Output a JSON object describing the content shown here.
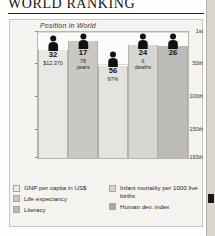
{
  "document": {
    "title": "WORLD RANKING"
  },
  "chart_data": {
    "type": "bar",
    "title": "WORLD RANKING",
    "subtitle": "Position in World",
    "ylabel": "Position in World",
    "xlabel": "",
    "grid": true,
    "legend_position": "bottom",
    "y_axis_inverted": true,
    "ylim": [
      1,
      193
    ],
    "ytick_labels": [
      "1st",
      "50th",
      "100th",
      "150th",
      "193th"
    ],
    "ytick_values": [
      1,
      50,
      100,
      150,
      193
    ],
    "categories": [
      "GNP per capita in US$",
      "Life expectancy",
      "Infant mortality per 1000 live births",
      "Literacy",
      "Human dev. index"
    ],
    "values": [
      32,
      17,
      56,
      24,
      26
    ],
    "bars": [
      {
        "category": "GNP per capita in US$",
        "rank": "32",
        "rank_value": 32,
        "detail": "$12,370",
        "color": "#e9e8e5"
      },
      {
        "category": "Life expectancy",
        "rank": "17",
        "rank_value": 17,
        "detail": "78 years",
        "detail_line1": "78",
        "detail_line2": "years",
        "color": "#c9c8c4"
      },
      {
        "category": "Infant mortality per 1000 live births",
        "rank": "56",
        "rank_value": 56,
        "detail": "97%",
        "color": "#e4e3e0"
      },
      {
        "category": "Literacy",
        "rank": "24",
        "rank_value": 24,
        "detail": "6 deaths",
        "detail_line1": "6",
        "detail_line2": "deaths",
        "color": "#d6d5d1"
      },
      {
        "category": "Human dev. index",
        "rank": "26",
        "rank_value": 26,
        "detail": "",
        "color": "#bcbbb7"
      }
    ],
    "legend": [
      {
        "label": "GNP per capita in US$",
        "color": "#e9e8e5"
      },
      {
        "label": "Life expectancy",
        "color": "#c9c8c4"
      },
      {
        "label": "Literacy",
        "color": "#b9b8b4"
      },
      {
        "label": "Infant mortality per 1000 live births",
        "color": "#d6d5d1"
      },
      {
        "label": "Human dev. index",
        "color": "#a9a8a4"
      }
    ]
  }
}
